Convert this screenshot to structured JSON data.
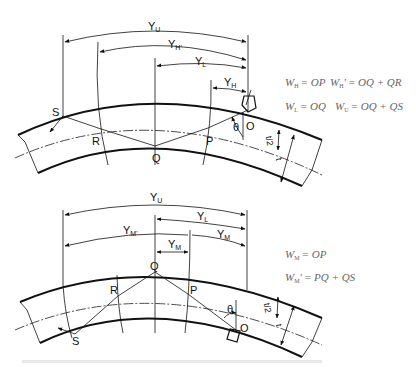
{
  "figure_top": {
    "dimensions": {
      "yu": {
        "main": "Y",
        "sub": "U"
      },
      "yh_prime": {
        "main": "Y",
        "sub": "H'"
      },
      "yl": {
        "main": "Y",
        "sub": "L"
      },
      "yh": {
        "main": "Y",
        "sub": "H"
      }
    },
    "points": {
      "s": "S",
      "r": "R",
      "q": "Q",
      "p": "P",
      "o": "O"
    },
    "angle": "θ",
    "half_thickness": "t/2",
    "thickness": "t",
    "equations": [
      {
        "lhs": "W",
        "lhs_sub": "H",
        "rhs": "= OP"
      },
      {
        "lhs": "W",
        "lhs_sub": "H",
        "prime": "'",
        "rhs": "= OQ + QR"
      },
      {
        "lhs": "W",
        "lhs_sub": "L",
        "rhs": "= OQ"
      },
      {
        "lhs": "W",
        "lhs_sub": "U",
        "rhs": "= OQ + QS"
      }
    ]
  },
  "figure_bottom": {
    "dimensions": {
      "yu": {
        "main": "Y",
        "sub": "U"
      },
      "yl": {
        "main": "Y",
        "sub": "L"
      },
      "ym_prime": {
        "main": "Y",
        "sub": "M'"
      },
      "ym_right": {
        "main": "Y",
        "sub": "M"
      },
      "ym_center": {
        "main": "Y",
        "sub": "M"
      }
    },
    "points": {
      "q": "Q",
      "r": "R",
      "p": "P",
      "s": "S",
      "o": "O"
    },
    "angle": "θ",
    "half_thickness": "t/2",
    "thickness": "t",
    "equations": [
      {
        "lhs": "W",
        "lhs_sub": "M",
        "rhs": "= OP"
      },
      {
        "lhs": "W",
        "lhs_sub": "M",
        "prime": "'",
        "rhs": "= PQ + QS"
      }
    ]
  }
}
